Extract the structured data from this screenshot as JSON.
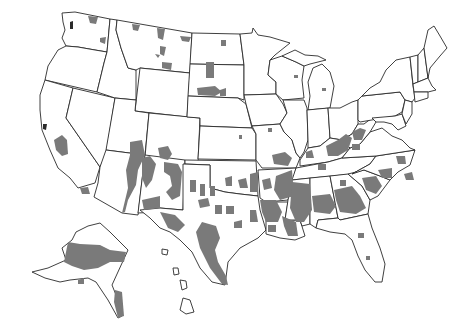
{
  "map": {
    "title": "",
    "region": "United States (counties)",
    "legend": [],
    "colors": {
      "background": "#ffffff",
      "state_border": "#2a2a2a",
      "highlighted_county": "#7a7a7a"
    },
    "highlighted_areas": [
      {
        "name": "Northern Washington"
      },
      {
        "name": "Montana reservations"
      },
      {
        "name": "North Dakota"
      },
      {
        "name": "South Dakota"
      },
      {
        "name": "Northern California"
      },
      {
        "name": "Arizona / New Mexico"
      },
      {
        "name": "Texas border"
      },
      {
        "name": "Oklahoma"
      },
      {
        "name": "Missouri bootheel"
      },
      {
        "name": "Arkansas / Louisiana"
      },
      {
        "name": "Mississippi Delta"
      },
      {
        "name": "Alabama Black Belt"
      },
      {
        "name": "Georgia"
      },
      {
        "name": "South Carolina"
      },
      {
        "name": "North Carolina"
      },
      {
        "name": "Appalachia (Kentucky / West Virginia)"
      },
      {
        "name": "Michigan"
      },
      {
        "name": "Wisconsin"
      },
      {
        "name": "Florida"
      },
      {
        "name": "Western Alaska"
      },
      {
        "name": "Southeast Alaska"
      }
    ],
    "insets": [
      "Alaska",
      "Hawaii"
    ]
  }
}
